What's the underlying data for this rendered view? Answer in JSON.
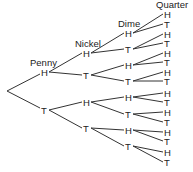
{
  "diagram": {
    "type": "tree",
    "levels": [
      "Penny",
      "Nickel",
      "Dime",
      "Quarter"
    ],
    "outcomes": [
      "H",
      "T"
    ],
    "headers": {
      "penny": "Penny",
      "nickel": "Nickel",
      "dime": "Dime",
      "quarter": "Quarter"
    },
    "penny": [
      {
        "label": "H"
      },
      {
        "label": "T"
      }
    ],
    "nickel": [
      {
        "label": "H"
      },
      {
        "label": "T"
      },
      {
        "label": "H"
      },
      {
        "label": "T"
      }
    ],
    "dime": [
      {
        "label": "H"
      },
      {
        "label": "T"
      },
      {
        "label": "H"
      },
      {
        "label": "T"
      },
      {
        "label": "H"
      },
      {
        "label": "T"
      },
      {
        "label": "H"
      },
      {
        "label": "T"
      }
    ],
    "quarter": [
      {
        "label": "H"
      },
      {
        "label": "T"
      },
      {
        "label": "H"
      },
      {
        "label": "T"
      },
      {
        "label": "H"
      },
      {
        "label": "T"
      },
      {
        "label": "H"
      },
      {
        "label": "T"
      },
      {
        "label": "H"
      },
      {
        "label": "T"
      },
      {
        "label": "H"
      },
      {
        "label": "T"
      },
      {
        "label": "H"
      },
      {
        "label": "T"
      },
      {
        "label": "H"
      },
      {
        "label": "T"
      }
    ]
  }
}
